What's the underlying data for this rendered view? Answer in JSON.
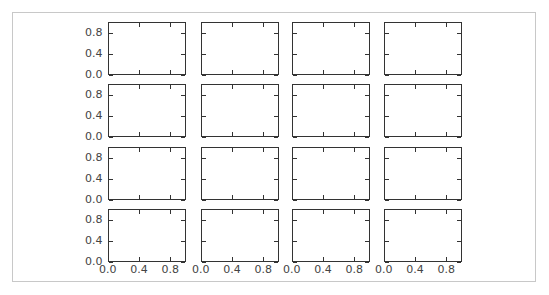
{
  "chart_data": {
    "type": "scatter",
    "title": "",
    "layout": {
      "rows": 4,
      "cols": 4,
      "sharex": true,
      "sharey": true
    },
    "xlabel": "",
    "ylabel": "",
    "xlim": [
      0.0,
      1.0
    ],
    "ylim": [
      0.0,
      1.0
    ],
    "xticks": [
      0.0,
      0.4,
      0.8
    ],
    "yticks": [
      0.0,
      0.4,
      0.8
    ],
    "xtick_labels": [
      "0.0",
      "0.4",
      "0.8"
    ],
    "ytick_labels": [
      "0.0",
      "0.4",
      "0.8"
    ],
    "grid": false,
    "legend": null,
    "subplots": [
      {
        "row": 0,
        "col": 0,
        "series": []
      },
      {
        "row": 0,
        "col": 1,
        "series": []
      },
      {
        "row": 0,
        "col": 2,
        "series": []
      },
      {
        "row": 0,
        "col": 3,
        "series": []
      },
      {
        "row": 1,
        "col": 0,
        "series": []
      },
      {
        "row": 1,
        "col": 1,
        "series": []
      },
      {
        "row": 1,
        "col": 2,
        "series": []
      },
      {
        "row": 1,
        "col": 3,
        "series": []
      },
      {
        "row": 2,
        "col": 0,
        "series": []
      },
      {
        "row": 2,
        "col": 1,
        "series": []
      },
      {
        "row": 2,
        "col": 2,
        "series": []
      },
      {
        "row": 2,
        "col": 3,
        "series": []
      },
      {
        "row": 3,
        "col": 0,
        "series": []
      },
      {
        "row": 3,
        "col": 1,
        "series": []
      },
      {
        "row": 3,
        "col": 2,
        "series": []
      },
      {
        "row": 3,
        "col": 3,
        "series": []
      }
    ]
  },
  "colors": {
    "axis": "#333333",
    "frame": "#c8c8c8",
    "text": "#444444"
  }
}
